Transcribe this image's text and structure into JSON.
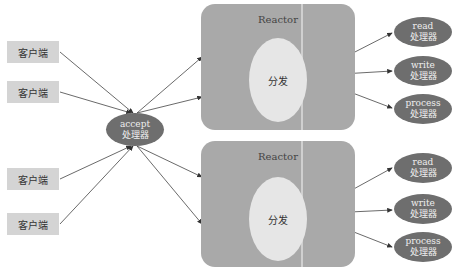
{
  "diagram": {
    "clients": [
      {
        "label": "客户端"
      },
      {
        "label": "客户端"
      },
      {
        "label": "客户端"
      },
      {
        "label": "客户端"
      }
    ],
    "acceptor": {
      "line1": "accept",
      "line2": "处理器"
    },
    "reactors": [
      {
        "title": "Reactor",
        "dispatch": "分发",
        "handlers": [
          {
            "line1": "read",
            "line2": "处理器"
          },
          {
            "line1": "write",
            "line2": "处理器"
          },
          {
            "line1": "process",
            "line2": "处理器"
          }
        ]
      },
      {
        "title": "Reactor",
        "dispatch": "分发",
        "handlers": [
          {
            "line1": "read",
            "line2": "处理器"
          },
          {
            "line1": "write",
            "line2": "处理器"
          },
          {
            "line1": "process",
            "line2": "处理器"
          }
        ]
      }
    ],
    "colors": {
      "client_box": "#d4d4d4",
      "reactor_box": "#a9a9a9",
      "dispatch_ellipse": "#e6e6e6",
      "handler_ellipse": "#6e6e6e",
      "arrow": "#333333"
    }
  }
}
